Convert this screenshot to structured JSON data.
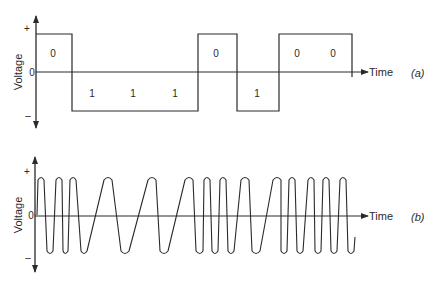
{
  "panels": {
    "a": {
      "tag": "(a)",
      "y_label": "Voltage",
      "x_label": "Time",
      "y_ticks": {
        "plus": "+",
        "zero": "0",
        "minus": "–"
      },
      "bits": [
        "0",
        "1",
        "1",
        "1",
        "0",
        "1",
        "0",
        "0"
      ],
      "description": "NRZ digital signal: 0 = positive voltage, 1 = negative voltage"
    },
    "b": {
      "tag": "(b)",
      "y_label": "Voltage",
      "x_label": "Time",
      "y_ticks": {
        "plus": "+",
        "zero": "0",
        "minus": "–"
      },
      "description": "Frequency-shift keyed waveform: high frequency for 0, low frequency for 1"
    }
  },
  "colors": {
    "line": "#2a2a2a",
    "background": "#ffffff"
  }
}
